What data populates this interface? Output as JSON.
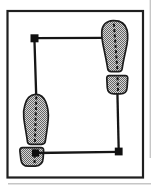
{
  "canvas": {
    "width": 152,
    "height": 185,
    "background": "#ffffff"
  },
  "palette": {
    "frame": "#1f1f1f",
    "line": "#161616",
    "outline": "#1c1c1c",
    "node": "#101010",
    "stipple_dark": "#656565",
    "stipple_light": "#d7d7d7",
    "artifact": "#c6c6c6"
  },
  "frame": {
    "x": 7.5,
    "y": 11,
    "width": 135.5,
    "height": 166.5,
    "stroke_width": 2.2
  },
  "step_path": {
    "stroke_width": 2.3,
    "lines": [
      {
        "name": "top-line",
        "x1": 34.5,
        "y1": 38.2,
        "x2": 105,
        "y2": 37.8,
        "layer": "under"
      },
      {
        "name": "left-line",
        "x1": 34.4,
        "y1": 38.2,
        "x2": 36.2,
        "y2": 96,
        "layer": "under"
      },
      {
        "name": "right-line",
        "x1": 117.4,
        "y1": 92.5,
        "x2": 118.7,
        "y2": 150,
        "layer": "under"
      },
      {
        "name": "bottom-line",
        "x1": 35.5,
        "y1": 153,
        "x2": 118.7,
        "y2": 151.8,
        "layer": "over"
      }
    ],
    "nodes": [
      {
        "name": "top-left-node",
        "x": 30.5,
        "y": 34.3,
        "size": 8.0
      },
      {
        "name": "bottom-right-node",
        "x": 114.8,
        "y": 147.6,
        "size": 7.8
      },
      {
        "name": "left-heel-node",
        "x": 31.9,
        "y": 149.4,
        "size": 7.2
      }
    ]
  },
  "footprints": {
    "outline_stroke_width": 1.7,
    "axis_stroke_width": 2,
    "axis_dash": "3 2.3",
    "items": [
      {
        "name": "right-footprint",
        "sole_path": "M101.8 31.5 C102.2 25 106.5 20.9 113 20.7 C119.5 20.5 125.3 23.2 127 30 C128.2 35 127.8 42 125.8 50 C124.3 57 122.8 63.5 122.2 68.5 Q121.8 71.7 118.6 71.7 L111.2 71.7 Q108.2 71.7 107.7 68.6 C106.8 62.5 104.8 53 103.2 45.5 C102.2 40.5 101.6 35.5 101.8 31.5 Z",
        "heel_path": "M109.3 75.6 L125.2 75.6 Q127.9 75.6 127.7 78.4 L127.1 87.5 Q126.7 93.9 120.3 93.9 L114 93.9 Q107.8 93.9 107.3 87.7 L106.8 78.4 Q106.6 75.6 109.3 75.6 Z",
        "axis_lines": [
          {
            "x1": 113.9,
            "y1": 23.8,
            "x2": 117.3,
            "y2": 69.3
          },
          {
            "x1": 117.5,
            "y1": 77.3,
            "x2": 118.1,
            "y2": 92.2
          }
        ]
      },
      {
        "name": "left-footprint",
        "sole_path": "M24.9 105 C26.2 98.8 30.3 94.5 35.3 94.3 C39.8 94.1 43.6 96.6 45.7 101.8 C47.7 106.8 48.7 113 48.2 119 C47.7 126.5 46.1 135.8 45.3 141.2 Q44.9 144.3 41.7 144.3 L30.7 144.3 Q27.8 144.3 27.4 141.3 C26.6 134.8 24.4 124 23.8 117.8 C23.3 112.8 23.8 108.2 24.9 105 Z",
        "heel_path": "M22.6 147.7 L40.9 147.7 Q43.8 147.7 43.6 150.6 L43.2 157.8 Q42.8 165.9 35.4 166.1 L28.6 166.2 Q21.8 166.3 20.9 159.6 L19.9 151.1 Q19.5 147.8 22.6 147.7 Z",
        "axis_lines": [
          {
            "x1": 36.3,
            "y1": 96.5,
            "x2": 34.9,
            "y2": 142.3
          },
          {
            "x1": 34.9,
            "y1": 149.5,
            "x2": 34.5,
            "y2": 164.5
          }
        ]
      }
    ]
  },
  "scan_artifacts": [
    {
      "name": "page-edge-right",
      "x1": 150.3,
      "y1": 0,
      "x2": 150.3,
      "y2": 158
    },
    {
      "name": "page-edge-bottom",
      "x1": 8,
      "y1": 183.8,
      "x2": 151,
      "y2": 183.8
    }
  ]
}
